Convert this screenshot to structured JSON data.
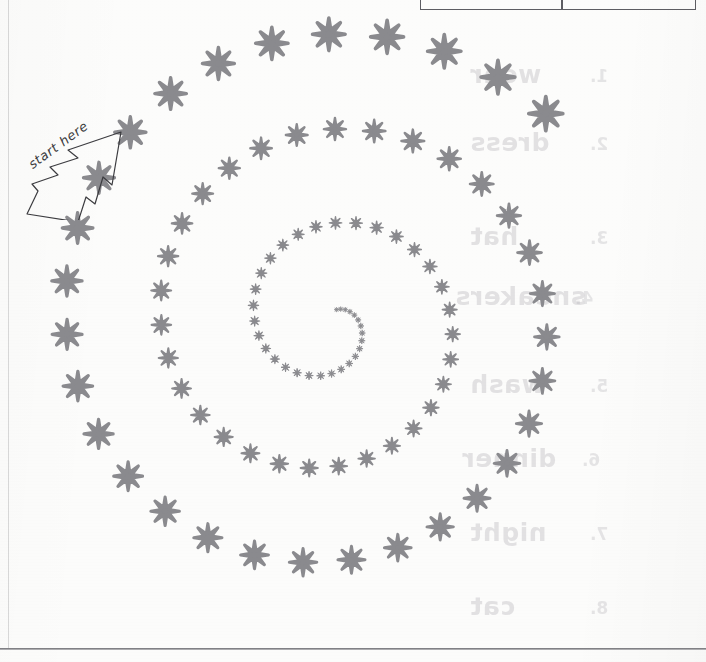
{
  "page": {
    "kind": "scanned-worksheet-page",
    "background_color": "#fcfcfb",
    "width": 706,
    "height": 662
  },
  "annotation": {
    "start_here_label": "start here",
    "arrow_direction": "up-right",
    "arrow_stroke_color": "#3c3c40"
  },
  "table_fragment": {
    "visible_portion": "bottom border row only",
    "border_color": "#5d5d62",
    "cells": [
      "",
      ""
    ]
  },
  "rules": {
    "left_margin_rule_color": "#5a5a5f",
    "bottom_rule_color": "#6e6e72"
  },
  "ghost_text": {
    "note": "faint show-through from the reverse side of the sheet, horizontally mirrored",
    "color": "#b9b7bc",
    "items": [
      {
        "text": "wear",
        "num": "1.",
        "x": 470,
        "y": 60
      },
      {
        "text": "dress",
        "num": "2.",
        "x": 470,
        "y": 128
      },
      {
        "text": "hat",
        "num": "3.",
        "x": 470,
        "y": 222
      },
      {
        "text": "sneakers",
        "num": "4.",
        "x": 455,
        "y": 282
      },
      {
        "text": "wash",
        "num": "5.",
        "x": 470,
        "y": 370
      },
      {
        "text": "dinner",
        "num": "6.",
        "x": 462,
        "y": 444
      },
      {
        "text": "night",
        "num": "7.",
        "x": 470,
        "y": 518
      },
      {
        "text": "cat",
        "num": "8.",
        "x": 470,
        "y": 592
      }
    ]
  },
  "chart_data": {
    "type": "scatter",
    "title": "",
    "subtitle": "",
    "xlabel": "",
    "ylabel": "",
    "marker": {
      "glyph": "asterisk-8-point",
      "color": "#8a8a8e",
      "points": 8
    },
    "spiral": {
      "center_x": 330,
      "center_y": 322,
      "start_angle_deg": 62,
      "direction": "counterclockwise",
      "turns": 3.05,
      "r_start": 14,
      "r_end": 300,
      "size_start": 5,
      "size_end": 34,
      "point_count": 96,
      "angular_step_deg": 11.5
    },
    "grid": false,
    "legend": false,
    "xlim": [
      0,
      706
    ],
    "ylim": [
      0,
      662
    ]
  }
}
